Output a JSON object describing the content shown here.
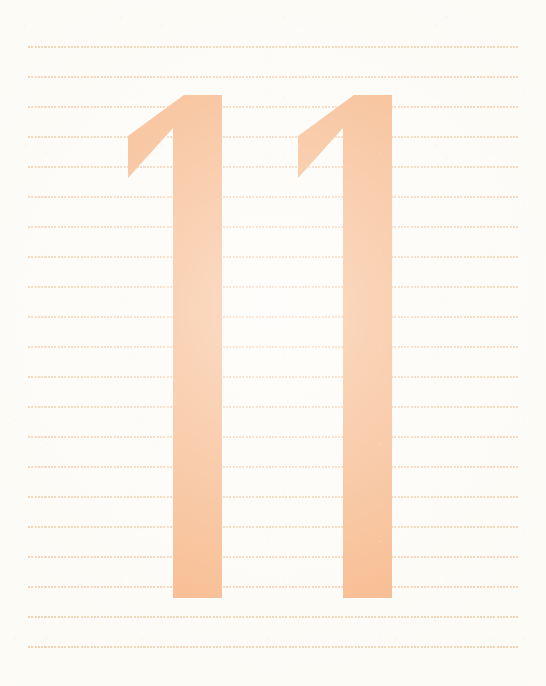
{
  "page": {
    "kind": "handwriting-practice-worksheet",
    "width": 546,
    "height": 686,
    "background_color": "#fdfbf6",
    "paper_tint_color": "#f8f3e7"
  },
  "colors": {
    "numeral_fill": "#f6b483",
    "numeral_fill_shade": "#f4ab76",
    "guide_line_dot": "#f2cfaf",
    "background": "#fdfbf6"
  },
  "guide_lines": {
    "count": 21,
    "first_y": 46,
    "spacing": 30,
    "x_start": 28,
    "x_end": 520,
    "dot_color": "#f2cfaf",
    "dot_size": 2,
    "dot_pitch": 3.3,
    "rows": [
      {
        "index": 1,
        "y": 46
      },
      {
        "index": 2,
        "y": 76
      },
      {
        "index": 3,
        "y": 106
      },
      {
        "index": 4,
        "y": 136
      },
      {
        "index": 5,
        "y": 166
      },
      {
        "index": 6,
        "y": 196
      },
      {
        "index": 7,
        "y": 226
      },
      {
        "index": 8,
        "y": 256
      },
      {
        "index": 9,
        "y": 286
      },
      {
        "index": 10,
        "y": 316
      },
      {
        "index": 11,
        "y": 346
      },
      {
        "index": 12,
        "y": 376
      },
      {
        "index": 13,
        "y": 406
      },
      {
        "index": 14,
        "y": 436
      },
      {
        "index": 15,
        "y": 466
      },
      {
        "index": 16,
        "y": 496
      },
      {
        "index": 17,
        "y": 526
      },
      {
        "index": 18,
        "y": 556
      },
      {
        "index": 19,
        "y": 586
      },
      {
        "index": 20,
        "y": 616
      },
      {
        "index": 21,
        "y": 646
      }
    ]
  },
  "numerals": {
    "character": "1",
    "count": 2,
    "fill_color": "#f6b483",
    "top_y": 95,
    "bottom_y": 598,
    "stem_width": 49,
    "flag_bottom_y": 178,
    "items": [
      {
        "label": "1",
        "name": "numeral-one-first",
        "stem_left": 173,
        "stem_right": 222,
        "flag_tip_x": 128,
        "top_y": 95,
        "bottom_y": 598
      },
      {
        "label": "1",
        "name": "numeral-one-second",
        "stem_left": 343,
        "stem_right": 392,
        "flag_tip_x": 298,
        "top_y": 95,
        "bottom_y": 598
      }
    ]
  }
}
